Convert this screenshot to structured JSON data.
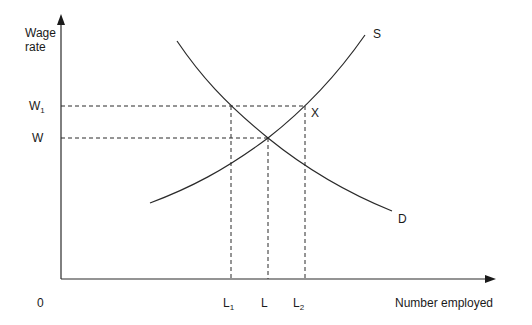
{
  "diagram": {
    "type": "supply-demand labour market",
    "y_axis_label_line1": "Wage",
    "y_axis_label_line2": "rate",
    "x_axis_label": "Number employed",
    "origin_label": "0",
    "y_ticks": [
      {
        "base": "W",
        "sub": "1"
      },
      {
        "base": "W",
        "sub": ""
      }
    ],
    "x_ticks": [
      {
        "base": "L",
        "sub": "1"
      },
      {
        "base": "L",
        "sub": ""
      },
      {
        "base": "L",
        "sub": "2"
      }
    ],
    "curves": {
      "supply_label": "S",
      "demand_label": "D"
    },
    "point_label": "X",
    "colors": {
      "line": "#2a2a2a",
      "text": "#1a1a1a",
      "background": "#ffffff"
    }
  }
}
